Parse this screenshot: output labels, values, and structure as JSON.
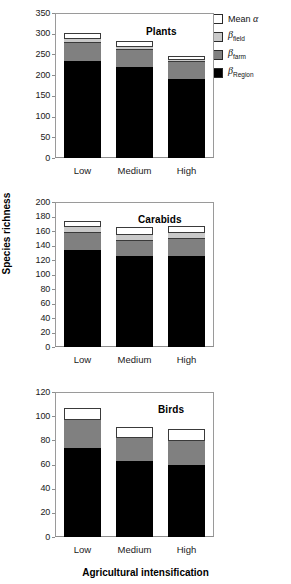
{
  "figure": {
    "ylabel": "Species richness",
    "xlabel": "Agricultural intensification"
  },
  "legend": {
    "items": [
      {
        "key": "alpha",
        "label": "Mean α",
        "color": "#ffffff"
      },
      {
        "key": "field",
        "label": "βfield",
        "base": "β",
        "sub": "field",
        "color": "#c9c9c9"
      },
      {
        "key": "farm",
        "label": "βfarm",
        "base": "β",
        "sub": "farm",
        "color": "#808080"
      },
      {
        "key": "region",
        "label": "βRegion",
        "base": "β",
        "sub": "Region",
        "color": "#000000"
      }
    ]
  },
  "chart_data": [
    {
      "type": "bar",
      "stacked": true,
      "title": "Plants",
      "xlabel": "",
      "ylabel": "",
      "ylim": [
        0,
        350
      ],
      "yticks": [
        0,
        50,
        100,
        150,
        200,
        250,
        300,
        350
      ],
      "grid": false,
      "legend_position": "outside top-right",
      "categories": [
        "Low",
        "Medium",
        "High"
      ],
      "series": [
        {
          "name": "βRegion",
          "color": "#000000",
          "values": [
            234,
            220,
            191
          ]
        },
        {
          "name": "βfarm",
          "color": "#808080",
          "values": [
            45,
            42,
            43
          ]
        },
        {
          "name": "βfield",
          "color": "#c9c9c9",
          "values": [
            10,
            8,
            6
          ]
        },
        {
          "name": "Mean α",
          "color": "#ffffff",
          "values": [
            13,
            13,
            6
          ]
        }
      ],
      "totals": [
        302,
        283,
        246
      ]
    },
    {
      "type": "bar",
      "stacked": true,
      "title": "Carabids",
      "xlabel": "",
      "ylabel": "Species richness",
      "ylim": [
        0,
        200
      ],
      "yticks": [
        0,
        20,
        40,
        60,
        80,
        100,
        120,
        140,
        160,
        180,
        200
      ],
      "grid": false,
      "categories": [
        "Low",
        "Medium",
        "High"
      ],
      "series": [
        {
          "name": "βRegion",
          "color": "#000000",
          "values": [
            134,
            126,
            126
          ]
        },
        {
          "name": "βfarm",
          "color": "#808080",
          "values": [
            24,
            22,
            25
          ]
        },
        {
          "name": "βfield",
          "color": "#c9c9c9",
          "values": [
            9,
            8,
            7
          ]
        },
        {
          "name": "Mean α",
          "color": "#ffffff",
          "values": [
            7,
            9,
            9
          ]
        }
      ],
      "totals": [
        174,
        165,
        167
      ]
    },
    {
      "type": "bar",
      "stacked": true,
      "title": "Birds",
      "xlabel": "Agricultural intensification",
      "ylabel": "",
      "ylim": [
        0,
        120
      ],
      "yticks": [
        0,
        20,
        40,
        60,
        80,
        100,
        120
      ],
      "grid": false,
      "categories": [
        "Low",
        "Medium",
        "High"
      ],
      "series": [
        {
          "name": "βRegion",
          "color": "#000000",
          "values": [
            74,
            63,
            60
          ]
        },
        {
          "name": "βfarm",
          "color": "#808080",
          "values": [
            24,
            20,
            20
          ]
        },
        {
          "name": "βfield",
          "color": "#c9c9c9",
          "values": [
            0,
            0,
            0
          ]
        },
        {
          "name": "Mean α",
          "color": "#ffffff",
          "values": [
            9,
            8,
            9
          ]
        }
      ],
      "totals": [
        107,
        91,
        89
      ]
    }
  ]
}
